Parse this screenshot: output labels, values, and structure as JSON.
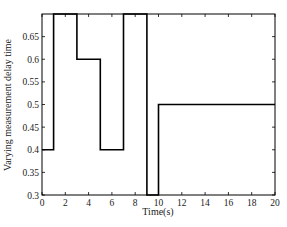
{
  "chart_data": {
    "type": "line",
    "step": true,
    "title": "",
    "xlabel": "Time(s)",
    "ylabel": "Varying measurement delay time",
    "xlim": [
      0,
      20
    ],
    "ylim": [
      0.3,
      0.7
    ],
    "xticks": [
      0,
      2,
      4,
      6,
      8,
      10,
      12,
      14,
      16,
      18,
      20
    ],
    "yticks": [
      0.3,
      0.35,
      0.4,
      0.45,
      0.5,
      0.55,
      0.6,
      0.65
    ],
    "grid": false,
    "legend": null,
    "series": [
      {
        "name": "delay",
        "color": "#000000",
        "x": [
          0,
          1,
          1,
          3,
          3,
          5,
          5,
          7,
          7,
          9,
          9,
          10,
          10,
          20
        ],
        "y": [
          0.4,
          0.4,
          0.7,
          0.7,
          0.6,
          0.6,
          0.4,
          0.4,
          0.7,
          0.7,
          0.3,
          0.3,
          0.5,
          0.5
        ]
      }
    ]
  }
}
